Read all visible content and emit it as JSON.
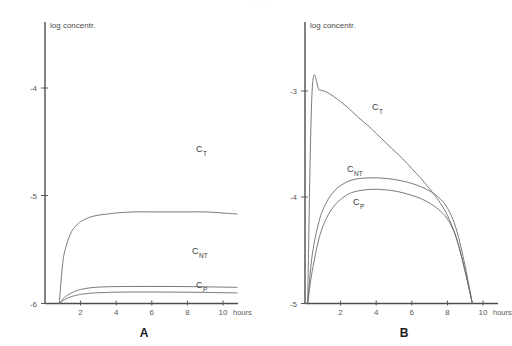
{
  "figure": {
    "background_color": "#ffffff",
    "axis_color": "#4d4d4d",
    "curve_color": "#6b6b6b",
    "text_color": "#3a3a3a"
  },
  "panels": [
    {
      "letter": "A",
      "y_axis_label": "log concentr.",
      "x_axis_label": "hours",
      "y_ticks": [
        "-4",
        "-5",
        "-6"
      ],
      "x_ticks": [
        "2",
        "4",
        "6",
        "8",
        "10"
      ],
      "series_labels": [
        {
          "base": "C",
          "sub": "T"
        },
        {
          "base": "C",
          "sub": "NT"
        },
        {
          "base": "C",
          "sub": "P"
        }
      ]
    },
    {
      "letter": "B",
      "y_axis_label": "log concentr.",
      "x_axis_label": "hours",
      "y_ticks": [
        "-3",
        "-4",
        "-5"
      ],
      "x_ticks": [
        "2",
        "4",
        "6",
        "8",
        "10"
      ],
      "series_labels": [
        {
          "base": "C",
          "sub": "T"
        },
        {
          "base": "C",
          "sub": "NT"
        },
        {
          "base": "C",
          "sub": "P"
        }
      ]
    }
  ],
  "chart_data": [
    {
      "type": "line",
      "panel": "A",
      "title": "",
      "xlabel": "hours",
      "ylabel": "log concentr.",
      "xlim": [
        0,
        10.9
      ],
      "ylim": [
        -6,
        -3.55
      ],
      "xticks": [
        2,
        4,
        6,
        8,
        10
      ],
      "yticks": [
        -4,
        -5,
        -6
      ],
      "grid": false,
      "legend": "inline-curve-labels",
      "x": [
        0.8,
        1.0,
        1.2,
        1.5,
        1.8,
        2.0,
        2.5,
        3.0,
        3.5,
        4.0,
        5.0,
        6.0,
        7.0,
        8.0,
        9.0,
        10.0,
        10.8
      ],
      "series": [
        {
          "name": "C_T",
          "label": "CT",
          "values": [
            -6.0,
            -5.62,
            -5.46,
            -5.33,
            -5.27,
            -5.24,
            -5.2,
            -5.18,
            -5.17,
            -5.16,
            -5.15,
            -5.15,
            -5.15,
            -5.15,
            -5.15,
            -5.16,
            -5.17
          ]
        },
        {
          "name": "C_NT",
          "label": "CNT",
          "values": [
            -6.0,
            -5.96,
            -5.93,
            -5.9,
            -5.88,
            -5.87,
            -5.855,
            -5.848,
            -5.845,
            -5.843,
            -5.842,
            -5.842,
            -5.842,
            -5.843,
            -5.845,
            -5.848,
            -5.85
          ]
        },
        {
          "name": "C_P",
          "label": "CP",
          "values": [
            -6.0,
            -5.975,
            -5.955,
            -5.935,
            -5.922,
            -5.916,
            -5.905,
            -5.9,
            -5.897,
            -5.895,
            -5.893,
            -5.893,
            -5.894,
            -5.895,
            -5.897,
            -5.9,
            -5.902
          ]
        }
      ]
    },
    {
      "type": "line",
      "panel": "B",
      "title": "",
      "xlabel": "hours",
      "ylabel": "log concentr.",
      "xlim": [
        0,
        10.9
      ],
      "ylim": [
        -5,
        -2.6
      ],
      "xticks": [
        2,
        4,
        6,
        8,
        10
      ],
      "yticks": [
        -3,
        -4,
        -5
      ],
      "grid": false,
      "legend": "inline-curve-labels",
      "x": [
        0.15,
        0.4,
        0.8,
        1.2,
        1.6,
        2.0,
        2.5,
        3.0,
        3.5,
        4.0,
        4.5,
        5.0,
        5.5,
        6.0,
        6.5,
        7.0,
        7.5,
        8.0,
        8.5,
        9.0,
        9.4
      ],
      "series": [
        {
          "name": "C_T",
          "label": "CT",
          "values": [
            -5.0,
            -3.0,
            -2.99,
            -3.01,
            -3.05,
            -3.1,
            -3.17,
            -3.25,
            -3.32,
            -3.4,
            -3.48,
            -3.56,
            -3.64,
            -3.73,
            -3.82,
            -3.92,
            -4.03,
            -4.17,
            -4.38,
            -4.7,
            -5.0
          ]
        },
        {
          "name": "C_NT",
          "label": "CNT",
          "values": [
            -5.0,
            -4.55,
            -4.22,
            -4.05,
            -3.95,
            -3.89,
            -3.845,
            -3.825,
            -3.818,
            -3.817,
            -3.822,
            -3.832,
            -3.848,
            -3.87,
            -3.9,
            -3.94,
            -4.0,
            -4.1,
            -4.3,
            -4.65,
            -5.0
          ]
        },
        {
          "name": "C_P",
          "label": "CP",
          "values": [
            -5.0,
            -4.7,
            -4.38,
            -4.2,
            -4.09,
            -4.02,
            -3.965,
            -3.94,
            -3.928,
            -3.925,
            -3.93,
            -3.94,
            -3.958,
            -3.982,
            -4.012,
            -4.055,
            -4.115,
            -4.205,
            -4.38,
            -4.7,
            -5.0
          ]
        }
      ]
    }
  ]
}
